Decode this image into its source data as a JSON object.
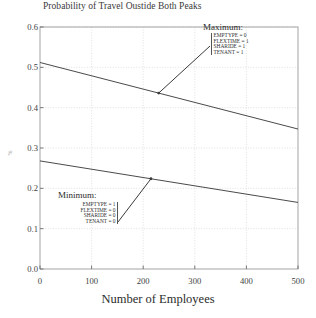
{
  "chart_data": {
    "type": "line",
    "title": "Probability of Travel Oustide Both Peaks",
    "xlabel": "Number of Employees",
    "ylabel": "%",
    "xlim": [
      0,
      500
    ],
    "ylim": [
      0.0,
      0.6
    ],
    "grid": true,
    "legend_position": "none",
    "xticks": [
      "0",
      "100",
      "200",
      "300",
      "400",
      "500"
    ],
    "xtick_values": [
      0,
      100,
      200,
      300,
      400,
      500
    ],
    "yticks": [
      "0.0",
      "0.1",
      "0.2",
      "0.3",
      "0.4",
      "0.5",
      "0.6"
    ],
    "ytick_values": [
      0.0,
      0.1,
      0.2,
      0.3,
      0.4,
      0.5,
      0.6
    ],
    "x": [
      0,
      500
    ],
    "series": [
      {
        "name": "Maximum",
        "values": [
          0.512,
          0.347
        ]
      },
      {
        "name": "Minimum",
        "values": [
          0.268,
          0.165
        ]
      }
    ],
    "annotations": [
      {
        "id": "maximum",
        "heading": "Maximum:",
        "rows": [
          "EMPTYPE = 0",
          "FLEXTIME = 1",
          "SHARIDE = 1",
          "TENANT = 1"
        ],
        "points_to_series": "Maximum",
        "points_to_x": 230
      },
      {
        "id": "minimum",
        "heading": "Minimum:",
        "rows": [
          "EMPTYPE = 1",
          "FLEXTIME = 0",
          "SHARIDE = 0",
          "TENANT = 0"
        ],
        "points_to_series": "Minimum",
        "points_to_x": 215
      }
    ]
  },
  "colors": {
    "line": "#4a4a4a",
    "grid": "#d9d9d9",
    "frame": "#9a9a9a",
    "text": "#2b2b2b",
    "background": "#ffffff"
  }
}
